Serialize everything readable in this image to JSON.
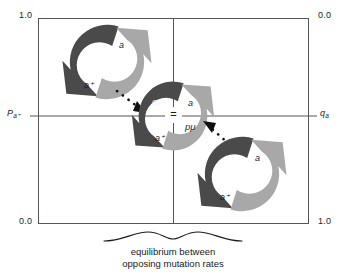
{
  "figure": {
    "type": "diagram",
    "plot_area": {
      "x_axis": {
        "left_corner_top": "0.0",
        "right_corner_top": "0.0",
        "left_corner_bottom": "0.0",
        "right_corner_bottom": "1.0"
      }
    },
    "corners": {
      "top_left": "1.0",
      "top_right": "0.0",
      "bottom_left": "0.0",
      "bottom_right": "1.0"
    },
    "axis_labels": {
      "left": {
        "base": "P",
        "subscript": "a⁺"
      },
      "right": {
        "base": "q",
        "subscript": "a"
      }
    },
    "caption": {
      "line1": "equilibrium between",
      "line2": "opposing mutation rates"
    },
    "center": {
      "equals_sign": "=",
      "dark_rate": "qν",
      "light_rate": "pμ"
    },
    "pinwheels": [
      {
        "id": "top-left",
        "dark_label": "a⁺",
        "light_label": "a"
      },
      {
        "id": "center",
        "dark_label": "a⁺",
        "light_label": "a"
      },
      {
        "id": "bottom-right",
        "dark_label": "a⁺",
        "light_label": "a"
      }
    ],
    "colors": {
      "dark_arrow": "#4a4a4a",
      "light_arrow": "#a8a8a8",
      "axis_line": "#555555",
      "frame": "#555555",
      "dotted_arrow": "#111111",
      "background": "#ffffff"
    }
  }
}
